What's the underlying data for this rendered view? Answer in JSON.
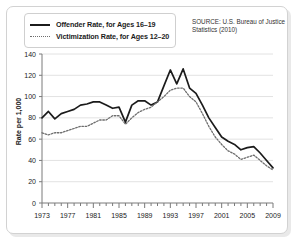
{
  "legend": {
    "items": [
      {
        "label": "Offender Rate, for Ages 16–19",
        "style": "solid",
        "color": "#1b1b1b"
      },
      {
        "label": "Victimization Rate, for Ages 12–20",
        "style": "dotted",
        "color": "#6e6e6e"
      }
    ]
  },
  "source_note": "SOURCE: U.S. Bureau of Justice Statistics (2010)",
  "axis": {
    "ylabel": "Rate per 1,000",
    "yticks": [
      "0",
      "20",
      "40",
      "60",
      "80",
      "100",
      "120",
      "140"
    ],
    "xticks": [
      "1973",
      "1977",
      "1981",
      "1985",
      "1989",
      "1993",
      "1997",
      "2001",
      "2005",
      "2009"
    ]
  },
  "chart_data": {
    "type": "line",
    "title": "",
    "xlabel": "",
    "ylabel": "Rate per 1,000",
    "xlim": [
      1973,
      2009
    ],
    "ylim": [
      0,
      140
    ],
    "grid": true,
    "legend_position": "top-left",
    "source": "SOURCE: U.S. Bureau of Justice Statistics (2010)",
    "x": [
      1973,
      1974,
      1975,
      1976,
      1977,
      1978,
      1979,
      1980,
      1981,
      1982,
      1983,
      1984,
      1985,
      1986,
      1987,
      1988,
      1989,
      1990,
      1991,
      1992,
      1993,
      1994,
      1995,
      1996,
      1997,
      1998,
      1999,
      2000,
      2001,
      2002,
      2003,
      2004,
      2005,
      2006,
      2007,
      2008,
      2009
    ],
    "series": [
      {
        "name": "Offender Rate, for Ages 16–19",
        "style": "solid",
        "color": "#1b1b1b",
        "values": [
          80,
          86,
          79,
          84,
          86,
          88,
          92,
          93,
          95,
          95,
          92,
          89,
          90,
          76,
          92,
          96,
          96,
          92,
          95,
          110,
          125,
          112,
          126,
          108,
          103,
          92,
          80,
          71,
          62,
          58,
          55,
          50,
          52,
          53,
          47,
          40,
          33
        ]
      },
      {
        "name": "Victimization Rate, for Ages 12–20",
        "style": "dotted",
        "color": "#6e6e6e",
        "values": [
          66,
          64,
          66,
          66,
          68,
          70,
          72,
          72,
          75,
          78,
          78,
          82,
          82,
          74,
          80,
          85,
          88,
          90,
          95,
          100,
          106,
          108,
          108,
          100,
          95,
          84,
          72,
          62,
          55,
          49,
          46,
          41,
          43,
          45,
          40,
          35,
          31
        ]
      }
    ]
  }
}
